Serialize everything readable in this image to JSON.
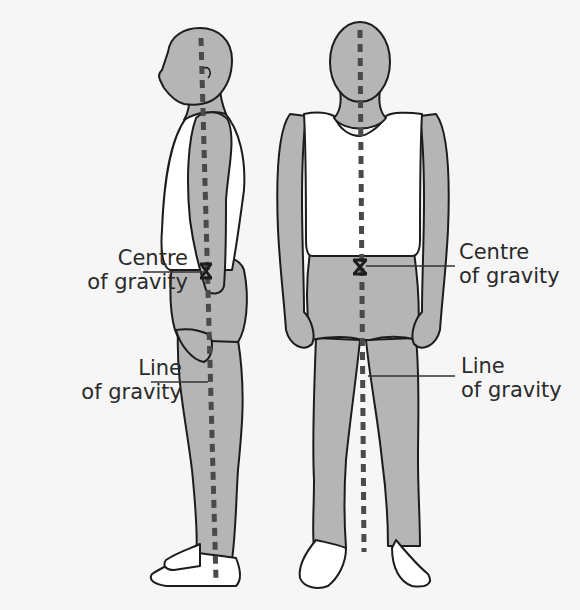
{
  "diagram": {
    "figures": [
      {
        "name": "side-view-figure",
        "view": "side"
      },
      {
        "name": "front-view-figure",
        "view": "front"
      }
    ],
    "labels": {
      "left_centre_of_gravity": {
        "line1": "Centre",
        "line2": "of gravity"
      },
      "left_line_of_gravity": {
        "line1": "Line",
        "line2": "of gravity"
      },
      "right_centre_of_gravity": {
        "line1": "Centre",
        "line2": "of gravity"
      },
      "right_line_of_gravity": {
        "line1": "Line",
        "line2": "of gravity"
      }
    },
    "markers": {
      "centre_of_gravity_symbol": "X",
      "line_of_gravity_style": "dashed"
    },
    "colors": {
      "background": "#f6f6f6",
      "skin": "#b5b5b5",
      "clothing": "#ffffff",
      "outline": "#1c1c1c",
      "gravity_line": "#4a4a4a"
    }
  }
}
